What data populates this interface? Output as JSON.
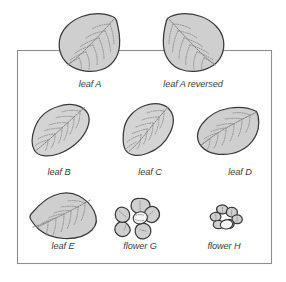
{
  "figure": {
    "title": "",
    "background_color": "#ffffff",
    "frame": {
      "name": "figure-border",
      "x": 17,
      "y": 50,
      "width": 255,
      "height": 214,
      "stroke_color": "#8e8e8e"
    },
    "palette": {
      "shape_fill": "#cfcfcf",
      "shape_fill_light": "#d8d8d8",
      "shape_outline": "#3a3a3a",
      "vein_color": "#8a8a8a",
      "label_color": "#3c3c3c",
      "frame_color": "#8e8e8e"
    },
    "rows": [
      {
        "name": "row-top",
        "items": [
          {
            "id": "leaf-a",
            "label": "leaf A",
            "kind": "leaf",
            "label_x": 90,
            "label_y": 87
          },
          {
            "id": "leaf-a-reversed",
            "label": "leaf A reversed",
            "kind": "leaf",
            "label_x": 193,
            "label_y": 87
          }
        ]
      },
      {
        "name": "row-middle",
        "items": [
          {
            "id": "leaf-b",
            "label": "leaf B",
            "kind": "leaf",
            "label_x": 59,
            "label_y": 175
          },
          {
            "id": "leaf-c",
            "label": "leaf C",
            "kind": "leaf",
            "label_x": 150,
            "label_y": 175
          },
          {
            "id": "leaf-d",
            "label": "leaf D",
            "kind": "leaf",
            "label_x": 240,
            "label_y": 175
          }
        ]
      },
      {
        "name": "row-bottom",
        "items": [
          {
            "id": "leaf-e",
            "label": "leaf E",
            "kind": "leaf",
            "label_x": 63,
            "label_y": 249
          },
          {
            "id": "flower-g",
            "label": "flower G",
            "kind": "flower",
            "label_x": 140,
            "label_y": 249
          },
          {
            "id": "flower-h",
            "label": "flower H",
            "kind": "flower",
            "label_x": 224,
            "label_y": 249
          }
        ]
      }
    ],
    "labels": {
      "leaf_a": "leaf A",
      "leaf_a_reversed": "leaf A reversed",
      "leaf_b": "leaf B",
      "leaf_c": "leaf C",
      "leaf_d": "leaf D",
      "leaf_e": "leaf E",
      "flower_g": "flower G",
      "flower_h": "flower H"
    }
  }
}
